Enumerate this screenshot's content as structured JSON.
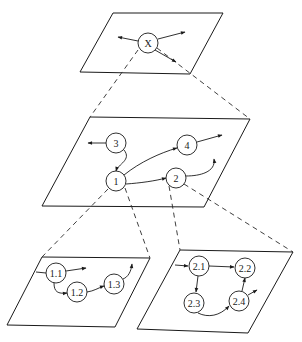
{
  "diagram": {
    "type": "hierarchical-decomposition",
    "levels": [
      {
        "name": "top",
        "nodes": [
          {
            "id": "X",
            "label": "X"
          }
        ]
      },
      {
        "name": "middle",
        "nodes": [
          {
            "id": "1",
            "label": "1"
          },
          {
            "id": "2",
            "label": "2"
          },
          {
            "id": "3",
            "label": "3"
          },
          {
            "id": "4",
            "label": "4"
          }
        ]
      },
      {
        "name": "bottom-left",
        "parent": "1",
        "nodes": [
          {
            "id": "1.1",
            "label": "1.1"
          },
          {
            "id": "1.2",
            "label": "1.2"
          },
          {
            "id": "1.3",
            "label": "1.3"
          }
        ]
      },
      {
        "name": "bottom-right",
        "parent": "2",
        "nodes": [
          {
            "id": "2.1",
            "label": "2.1"
          },
          {
            "id": "2.2",
            "label": "2.2"
          },
          {
            "id": "2.3",
            "label": "2.3"
          },
          {
            "id": "2.4",
            "label": "2.4"
          }
        ]
      }
    ],
    "edges": [
      {
        "from": "3",
        "to": "1"
      },
      {
        "from": "1",
        "to": "4"
      },
      {
        "from": "1",
        "to": "2"
      },
      {
        "from": "1.1",
        "to": "1.2"
      },
      {
        "from": "1.2",
        "to": "1.3"
      },
      {
        "from": "2.1",
        "to": "2.2"
      },
      {
        "from": "2.1",
        "to": "2.3"
      },
      {
        "from": "2.3",
        "to": "2.4"
      },
      {
        "from": "2.4",
        "to": "2.2"
      }
    ],
    "expansions": [
      {
        "from": "X",
        "to": "middle"
      },
      {
        "from": "1",
        "to": "bottom-left"
      },
      {
        "from": "2",
        "to": "bottom-right"
      }
    ]
  },
  "colors": {
    "line": "#1a1a1a",
    "background": "#ffffff"
  }
}
